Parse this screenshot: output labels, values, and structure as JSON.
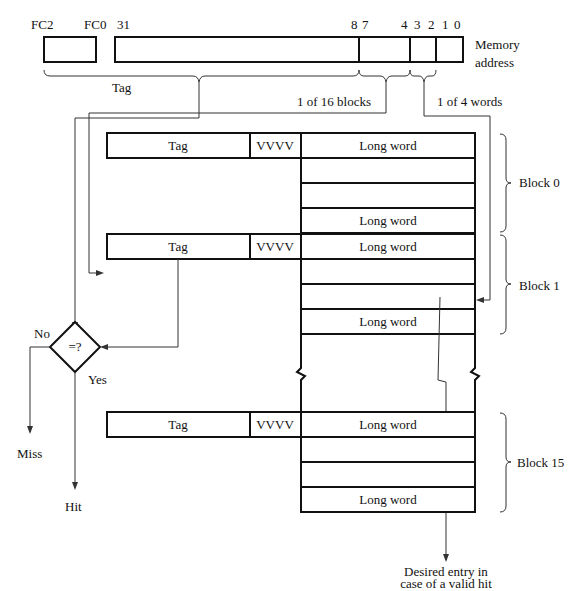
{
  "address": {
    "labels": {
      "fc2": "FC2",
      "fc0": "FC0",
      "b31": "31",
      "b8": "8",
      "b7": "7",
      "b4": "4",
      "b3": "3",
      "b2": "2",
      "b1": "1",
      "b0": "0"
    },
    "title_line1": "Memory",
    "title_line2": "address",
    "tag_label": "Tag",
    "blocks_label": "1 of 16 blocks",
    "words_label": "1 of 4 words"
  },
  "cache": {
    "blocks": [
      {
        "name": "Block 0",
        "tag": "Tag",
        "valid": "VVVV",
        "first_word": "Long word",
        "last_word": "Long word"
      },
      {
        "name": "Block 1",
        "tag": "Tag",
        "valid": "VVVV",
        "first_word": "Long word",
        "last_word": "Long word"
      },
      {
        "name": "Block 15",
        "tag": "Tag",
        "valid": "VVVV",
        "first_word": "Long word",
        "last_word": "Long word"
      }
    ]
  },
  "comparator": {
    "symbol": "=?",
    "no": "No",
    "yes": "Yes",
    "miss": "Miss",
    "hit": "Hit"
  },
  "result": {
    "line1": "Desired entry in",
    "line2": "case of a valid hit"
  }
}
